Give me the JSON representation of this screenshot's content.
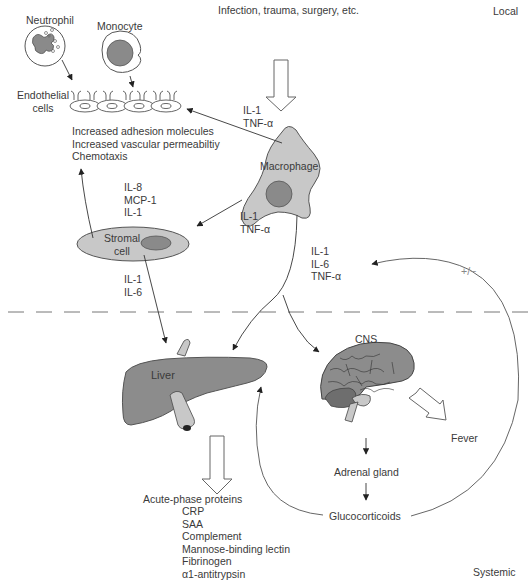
{
  "region_labels": {
    "trigger": "Infection, trauma, surgery, etc.",
    "local": "Local",
    "systemic": "Systemic"
  },
  "cells": {
    "neutrophil": "Neutrophil",
    "monocyte": "Monocyte",
    "endothelial": [
      "Endothelial",
      "cells"
    ],
    "macrophage": "Macrophage",
    "stromal": [
      "Stromal",
      "cell"
    ]
  },
  "organs": {
    "liver": "Liver",
    "cns": "CNS"
  },
  "endothelial_effects": [
    "Increased adhesion molecules",
    "Increased vascular permeabiltiy",
    "Chemotaxis"
  ],
  "cytokines": {
    "macrophage_to_endothelium": [
      "IL-1",
      "TNF-α"
    ],
    "stromal_to_endothelium": [
      "IL-8",
      "MCP-1",
      "IL-1"
    ],
    "macrophage_to_stromal": [
      "IL-1",
      "TNF-α"
    ],
    "stromal_to_liver": [
      "IL-1",
      "IL-6"
    ],
    "macrophage_systemic": [
      "IL-1",
      "IL-6",
      "TNF-α"
    ]
  },
  "feedback_label": "+/−",
  "cns_outputs": {
    "fever": "Fever",
    "adrenal": "Adrenal gland",
    "glucocorticoids": "Glucocorticoids"
  },
  "acute_phase": {
    "title": "Acute-phase proteins",
    "items": [
      "CRP",
      "SAA",
      "Complement",
      "Mannose-binding lectin",
      "Fibrinogen",
      "α1-antitrypsin"
    ]
  },
  "colors": {
    "cell_fill": "#c8c8c8",
    "nucleus_fill": "#8a8a8a",
    "organ_fill": "#8c8c8c",
    "line": "#555555",
    "text": "#3a3a3a"
  }
}
